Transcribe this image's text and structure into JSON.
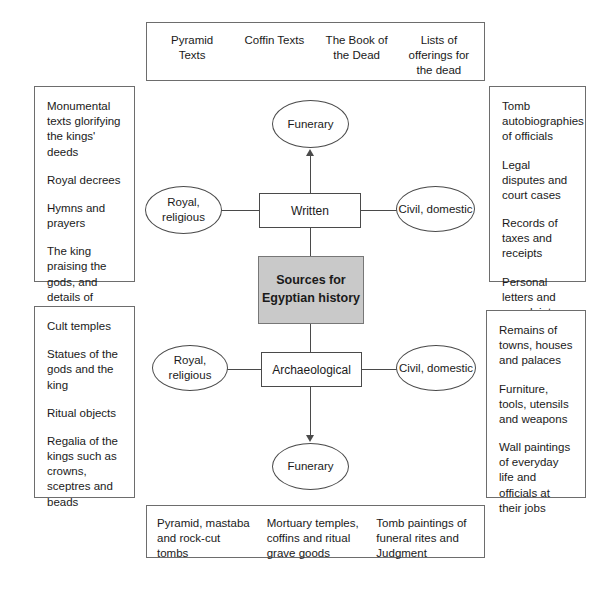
{
  "diagram": {
    "title": "Sources for Egyptian history",
    "central_node": {
      "label": "Sources for Egyptian history",
      "fill": "#c9c9c9"
    },
    "branches": {
      "written": {
        "label": "Written",
        "funerary": "Funerary",
        "royal_religious": "Royal, religious",
        "civil_domestic": "Civil, domestic"
      },
      "archaeological": {
        "label": "Archaeological",
        "funerary": "Funerary",
        "royal_religious": "Royal, religious",
        "civil_domestic": "Civil, domestic"
      }
    },
    "panels": {
      "written_funerary": {
        "columns": [
          "Pyramid Texts",
          "Coffin Texts",
          "The  Book of the Dead",
          "Lists of offerings for the dead"
        ]
      },
      "written_royal_religious": {
        "entries": [
          "Monumental texts glorifying the kings' deeds",
          "Royal decrees",
          "Hymns and prayers",
          "The king praising the gods, and details of temple worship"
        ]
      },
      "written_civil_domestic": {
        "entries": [
          "Tomb autobiographies of officials",
          "Legal disputes and court cases",
          "Records of taxes and receipts",
          "Personal letters and complaints against neighbours"
        ]
      },
      "archaeological_royal_religious": {
        "entries": [
          "Cult temples",
          "Statues of the gods and the king",
          "Ritual objects",
          "Regalia of the kings such as crowns, sceptres and beads"
        ]
      },
      "archaeological_civil_domestic": {
        "entries": [
          "Remains of towns, houses and palaces",
          "Furniture, tools, utensils and weapons",
          "Wall paintings of everyday life and officials at their jobs"
        ]
      },
      "archaeological_funerary": {
        "columns": [
          "Pyramid, mastaba and rock-cut tombs",
          "Mortuary temples, coffins and ritual grave goods",
          "Tomb paintings of funeral rites and Judgment"
        ]
      }
    }
  }
}
